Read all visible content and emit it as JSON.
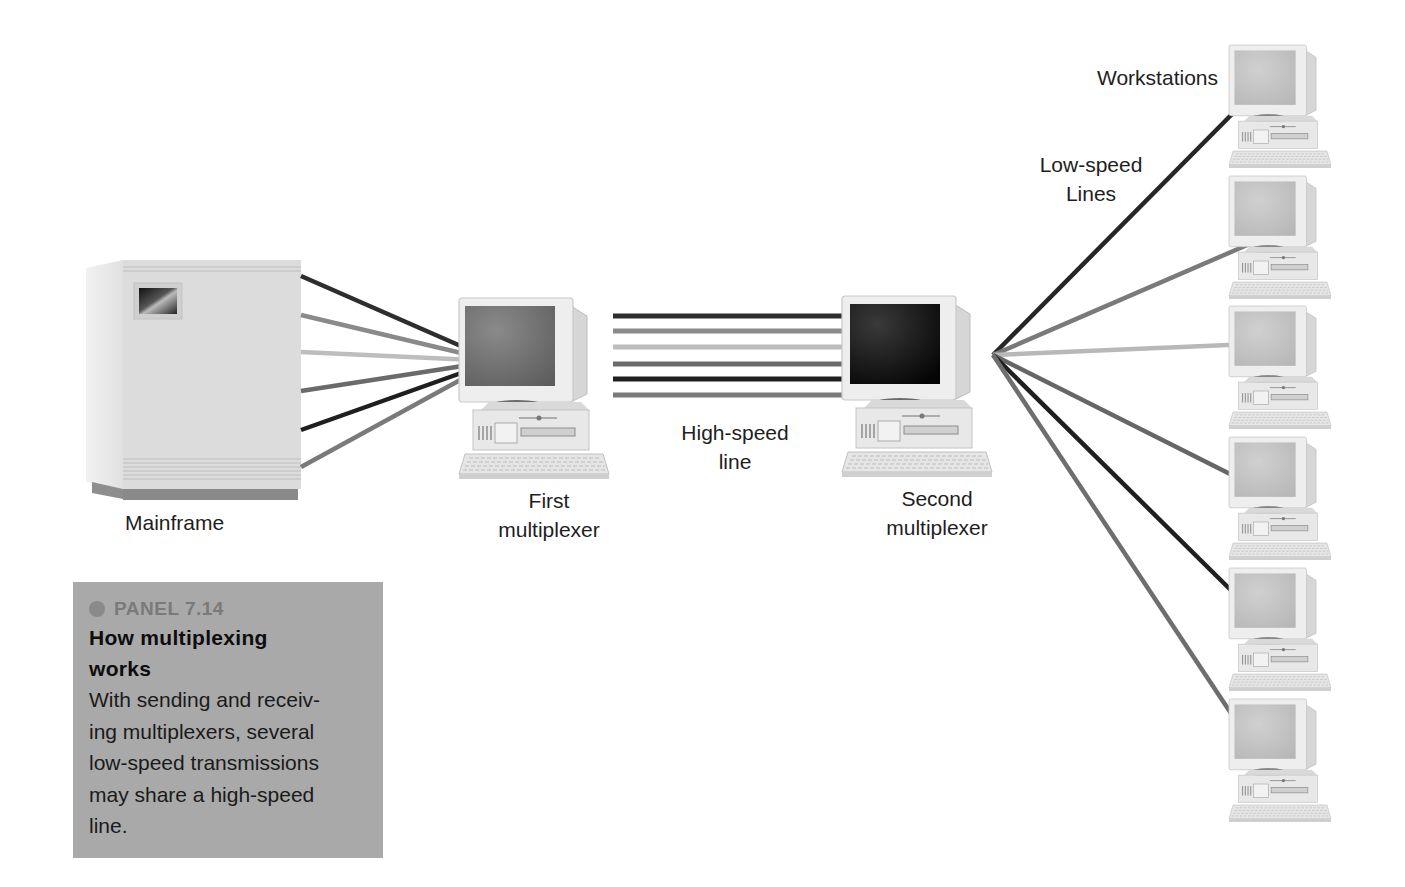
{
  "figure": {
    "panel": {
      "tag": "PANEL 7.14",
      "title_lines": [
        "How multiplexing",
        "works"
      ],
      "body_lines": [
        "With sending and receiv-",
        "ing multiplexers, several",
        "low-speed transmissions",
        "may share a high-speed",
        "line."
      ]
    },
    "labels": {
      "mainframe": "Mainframe",
      "first_mux": [
        "First",
        "multiplexer"
      ],
      "second_mux": [
        "Second",
        "multiplexer"
      ],
      "high_speed": [
        "High-speed",
        "line"
      ],
      "low_speed": [
        "Low-speed",
        "Lines"
      ],
      "workstations": "Workstations"
    },
    "nodes": {
      "mainframe": {
        "type": "mainframe"
      },
      "first_multiplexer": {
        "type": "computer",
        "screen": "#6e6e6e"
      },
      "second_multiplexer": {
        "type": "computer",
        "screen": "#1a1a1a"
      },
      "workstations": [
        {
          "id": 1
        },
        {
          "id": 2
        },
        {
          "id": 3
        },
        {
          "id": 4
        },
        {
          "id": 5
        },
        {
          "id": 6
        }
      ]
    },
    "line_colors": [
      "#2e2e2e",
      "#8a8a8a",
      "#bdbdbd",
      "#6a6a6a",
      "#1f1f1f",
      "#7a7a7a"
    ],
    "edges": {
      "mainframe_to_first": 6,
      "high_speed_parallel": 6,
      "second_to_workstations": 6
    }
  }
}
